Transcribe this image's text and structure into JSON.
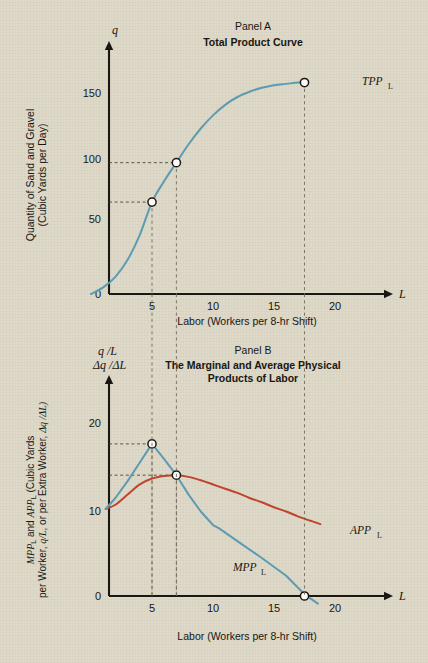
{
  "figure": {
    "background_color": "#ded9c8",
    "blue_color": "#5b9cb5",
    "red_color": "#bf442a",
    "ink_color": "#15130f"
  },
  "panel_a": {
    "kicker": "Panel  A",
    "title": "Total Product  Curve",
    "y_axis_var": "q",
    "x_axis_var": "L",
    "y_axis_title_line1": "Quantity of Sand and Gravel",
    "y_axis_title_line2": "(Cubic Yards per Day)",
    "x_axis_title": "Labor (Workers per 8-hr Shift)",
    "curve_label": "TPP",
    "curve_label_sub": "L",
    "y_ticks": [
      0,
      50,
      100,
      150
    ],
    "x_ticks": [
      5,
      10,
      15,
      20
    ]
  },
  "panel_b": {
    "kicker": "Panel B",
    "title_line1": "The Marginal and Average Physical",
    "title_line2": "Products of Labor",
    "y_axis_var_line1": "q /L",
    "y_axis_var_line2": "Δq /ΔL",
    "x_axis_var": "L",
    "y_axis_title_seg1": "MPP",
    "y_axis_title_seg1_sub": "L",
    "y_axis_title_seg2": " and ",
    "y_axis_title_seg3": "APP",
    "y_axis_title_seg3_sub": "L",
    "y_axis_title_seg4": " (Cubic Yards",
    "y_axis_title_line2_a": "per Worker, ",
    "y_axis_title_line2_b": "q/L",
    "y_axis_title_line2_c": ", or per Extra Worker, ",
    "y_axis_title_line2_d": "Δq /ΔL)",
    "x_axis_title": "Labor (Workers per 8-hr Shift)",
    "mpp_label": "MPP",
    "mpp_label_sub": "L",
    "app_label": "APP",
    "app_label_sub": "L",
    "y_ticks": [
      0,
      10,
      20
    ],
    "x_ticks": [
      5,
      10,
      15,
      20
    ]
  },
  "chart_data": [
    {
      "type": "line",
      "panel": "Panel A",
      "title": "Total Product Curve",
      "xlabel": "Labor (Workers per 8-hr Shift)",
      "ylabel": "Quantity of Sand and Gravel (Cubic Yards per Day)",
      "xlim": [
        0,
        22
      ],
      "ylim": [
        0,
        180
      ],
      "grid": false,
      "legend": "inline-curve-label",
      "series": [
        {
          "name": "TPP_L",
          "color": "#5b9cb5",
          "x": [
            0,
            1,
            2,
            3,
            4,
            5,
            6,
            7,
            8,
            9,
            10,
            11,
            12,
            13,
            14,
            15,
            16,
            17,
            17.5
          ],
          "y": [
            0,
            5,
            13,
            26,
            45,
            70,
            86,
            100,
            114,
            126,
            136,
            144,
            150,
            154,
            157,
            159,
            160,
            161,
            161
          ]
        }
      ],
      "markers": [
        {
          "x": 5,
          "y": 70,
          "guides": [
            "horizontal",
            "vertical"
          ]
        },
        {
          "x": 7,
          "y": 100,
          "guides": [
            "horizontal",
            "vertical"
          ]
        },
        {
          "x": 17.5,
          "y": 161,
          "guides": [
            "vertical"
          ]
        }
      ]
    },
    {
      "type": "line",
      "panel": "Panel B",
      "title": "The Marginal and Average Physical Products of Labor",
      "xlabel": "Labor (Workers per 8-hr Shift)",
      "ylabel": "MPP_L and APP_L (Cubic Yards per Worker, q/L, or per Extra Worker, dq/dL)",
      "xlim": [
        0,
        22
      ],
      "ylim": [
        0,
        24
      ],
      "grid": false,
      "legend": "inline-curve-label",
      "series": [
        {
          "name": "MPP_L",
          "color": "#5b9cb5",
          "x": [
            1.2,
            2,
            3,
            4,
            5,
            6,
            7,
            8,
            9,
            10,
            10.5,
            12,
            14,
            16,
            17.5,
            18.6
          ],
          "y": [
            10.3,
            11.6,
            13.6,
            15.8,
            18.0,
            16.2,
            14.3,
            12.0,
            10.0,
            8.4,
            8.0,
            6.5,
            4.5,
            2.4,
            0.2,
            -0.9
          ]
        },
        {
          "name": "APP_L",
          "color": "#bf442a",
          "x": [
            1.2,
            2,
            3,
            4,
            5,
            6,
            7,
            8,
            9,
            10,
            11,
            12,
            13,
            14,
            15,
            16,
            17,
            18,
            18.8
          ],
          "y": [
            10.3,
            10.8,
            12.0,
            13.2,
            13.9,
            14.2,
            14.3,
            14.1,
            13.7,
            13.2,
            12.7,
            12.2,
            11.6,
            11.1,
            10.5,
            10.0,
            9.4,
            8.9,
            8.5
          ]
        }
      ],
      "markers": [
        {
          "x": 5,
          "y": 18.0,
          "guides": [
            "horizontal",
            "vertical"
          ]
        },
        {
          "x": 7,
          "y": 14.3,
          "guides": [
            "horizontal",
            "vertical"
          ]
        },
        {
          "x": 17.5,
          "y": 0,
          "guides": [
            "vertical"
          ]
        }
      ]
    }
  ]
}
